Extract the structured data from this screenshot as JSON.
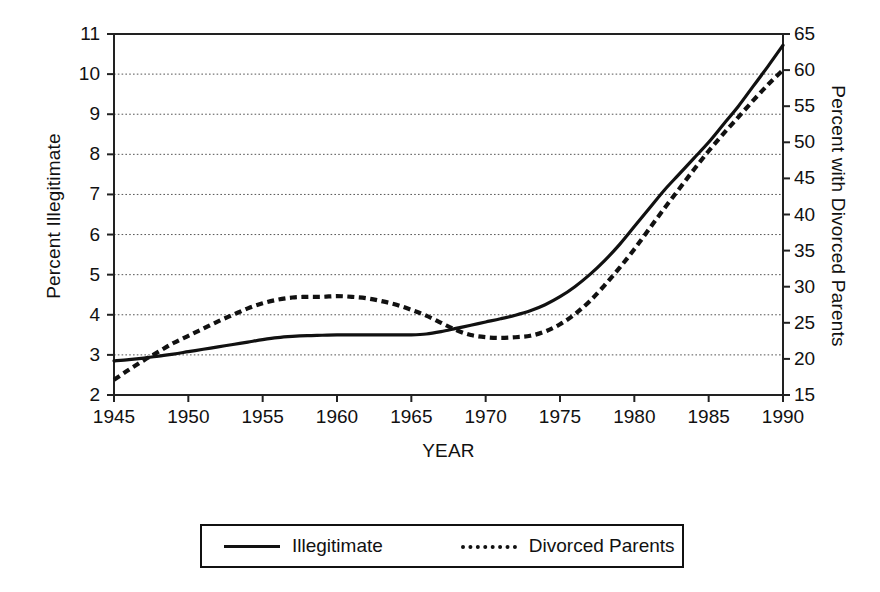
{
  "chart_data": {
    "type": "line",
    "title": "",
    "xlabel": "YEAR",
    "ylabel": "Percent Illegitimate",
    "ylabel_right": "Percent with Divorced Parents",
    "xlim": [
      1945,
      1990
    ],
    "ylim": [
      2,
      11
    ],
    "ylim_right": [
      15,
      65
    ],
    "grid": true,
    "legend_position": "bottom-center",
    "xticks": [
      "1945",
      "1950",
      "1955",
      "1960",
      "1965",
      "1970",
      "1975",
      "1980",
      "1985",
      "1990"
    ],
    "yticks_left": [
      "2",
      "3",
      "4",
      "5",
      "6",
      "7",
      "8",
      "9",
      "10",
      "11"
    ],
    "yticks_right": [
      "15",
      "20",
      "25",
      "30",
      "35",
      "40",
      "45",
      "50",
      "55",
      "60",
      "65"
    ],
    "x": [
      1945,
      1946,
      1947,
      1948,
      1949,
      1950,
      1951,
      1952,
      1953,
      1954,
      1955,
      1956,
      1957,
      1958,
      1959,
      1960,
      1961,
      1962,
      1963,
      1964,
      1965,
      1966,
      1967,
      1968,
      1969,
      1970,
      1971,
      1972,
      1973,
      1974,
      1975,
      1976,
      1977,
      1978,
      1979,
      1980,
      1981,
      1982,
      1983,
      1984,
      1985,
      1986,
      1987,
      1988,
      1989,
      1990
    ],
    "series": [
      {
        "name": "Illegitimate",
        "axis": "left",
        "style": "solid",
        "color": "#111111",
        "values": [
          2.85,
          2.88,
          2.92,
          2.97,
          3.02,
          3.08,
          3.14,
          3.2,
          3.26,
          3.32,
          3.38,
          3.43,
          3.46,
          3.48,
          3.49,
          3.5,
          3.5,
          3.5,
          3.5,
          3.5,
          3.5,
          3.52,
          3.58,
          3.66,
          3.74,
          3.82,
          3.9,
          3.99,
          4.1,
          4.25,
          4.45,
          4.7,
          5.0,
          5.35,
          5.75,
          6.2,
          6.65,
          7.1,
          7.5,
          7.9,
          8.3,
          8.75,
          9.2,
          9.7,
          10.2,
          10.72
        ]
      },
      {
        "name": "Divorced Parents",
        "axis": "right",
        "style": "dotted",
        "color": "#111111",
        "values": [
          17.1,
          18.5,
          19.8,
          21.0,
          22.2,
          23.2,
          24.2,
          25.2,
          26.1,
          27.0,
          27.7,
          28.2,
          28.5,
          28.6,
          28.6,
          28.7,
          28.6,
          28.4,
          28.0,
          27.5,
          26.8,
          26.0,
          25.0,
          24.0,
          23.3,
          23.0,
          22.9,
          23.0,
          23.2,
          23.8,
          24.8,
          26.2,
          28.0,
          30.2,
          32.6,
          35.2,
          38.0,
          40.8,
          43.5,
          46.2,
          48.8,
          51.2,
          53.5,
          55.8,
          58.0,
          60.0
        ]
      }
    ]
  },
  "legend": {
    "items": [
      {
        "label": "Illegitimate",
        "style": "solid"
      },
      {
        "label": "Divorced Parents",
        "style": "dotted"
      }
    ]
  }
}
